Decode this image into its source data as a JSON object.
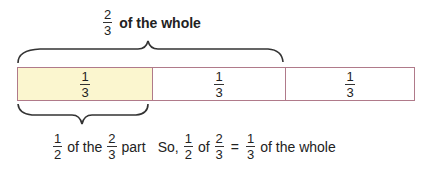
{
  "top_label": {
    "fraction": {
      "num": "2",
      "den": "3"
    },
    "text": "of the whole"
  },
  "bar": {
    "cells": [
      {
        "num": "1",
        "den": "3",
        "fill": "#fbf6cf"
      },
      {
        "num": "1",
        "den": "3",
        "fill": "#ffffff"
      },
      {
        "num": "1",
        "den": "3",
        "fill": "#ffffff"
      }
    ],
    "border_color": "#b07a8a"
  },
  "bottom_label": {
    "part1": {
      "num": "1",
      "den": "2"
    },
    "text1": "of the",
    "part2": {
      "num": "2",
      "den": "3"
    },
    "text2": "part",
    "text3": "So,",
    "part3": {
      "num": "1",
      "den": "2"
    },
    "text4": "of",
    "part4": {
      "num": "2",
      "den": "3"
    },
    "equals": "=",
    "part5": {
      "num": "1",
      "den": "3"
    },
    "text5": "of the whole"
  }
}
